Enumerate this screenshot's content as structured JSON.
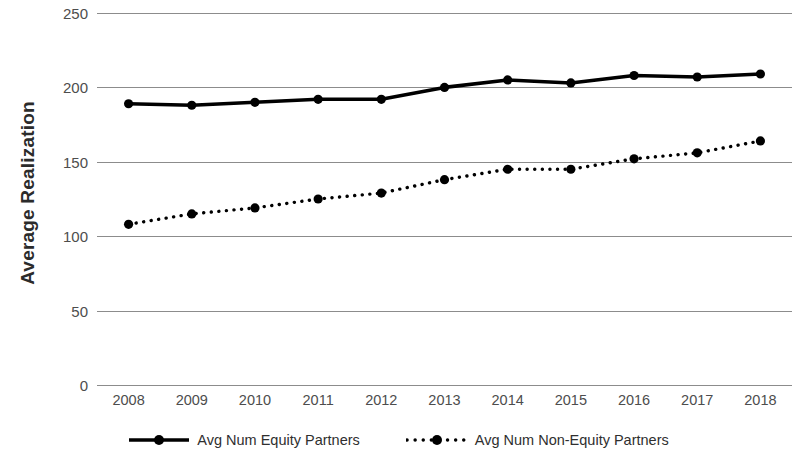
{
  "chart_data": {
    "type": "line",
    "title": "",
    "xlabel": "",
    "ylabel": "Average Realization",
    "categories": [
      "2008",
      "2009",
      "2010",
      "2011",
      "2012",
      "2013",
      "2014",
      "2015",
      "2016",
      "2017",
      "2018"
    ],
    "x": [
      2008,
      2009,
      2010,
      2011,
      2012,
      2013,
      2014,
      2015,
      2016,
      2017,
      2018
    ],
    "ylim": [
      0,
      250
    ],
    "yticks": [
      0,
      50,
      100,
      150,
      200,
      250
    ],
    "ytick_labels": [
      "0",
      "50",
      "100",
      "150",
      "200",
      "250"
    ],
    "grid": true,
    "legend_position": "bottom",
    "series": [
      {
        "name": "Avg Num Equity Partners",
        "style": "solid",
        "marker": "filled-circle",
        "color": "#000000",
        "values": [
          189,
          188,
          190,
          192,
          192,
          200,
          205,
          203,
          208,
          207,
          209
        ]
      },
      {
        "name": "Avg Num Non-Equity Partners",
        "style": "dotted",
        "marker": "filled-circle",
        "color": "#000000",
        "values": [
          108,
          115,
          119,
          125,
          129,
          138,
          145,
          145,
          152,
          156,
          164
        ]
      }
    ]
  },
  "axes": {
    "y_title": "Average Realization",
    "gridline_color": "#8c8c8c"
  },
  "legend": {
    "items": [
      {
        "label": "Avg Num Equity Partners",
        "style": "solid"
      },
      {
        "label": "Avg Num Non-Equity Partners",
        "style": "dotted"
      }
    ]
  }
}
